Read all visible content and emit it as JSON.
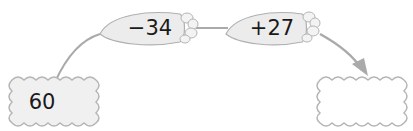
{
  "diagram": {
    "type": "arrow-operation-chain",
    "start_box": {
      "value": "60"
    },
    "operations": [
      {
        "label": "−34",
        "shape": "carrot"
      },
      {
        "label": "+27",
        "shape": "carrot"
      }
    ],
    "end_box": {
      "value": ""
    },
    "colors": {
      "line": "#aaaaaa",
      "carrot_fill": "#ececec",
      "carrot_stroke": "#b0b0b0",
      "box_fill": "#f0f0f0",
      "box_stroke": "#b5b5b5",
      "text": "#1a1a1a"
    }
  }
}
